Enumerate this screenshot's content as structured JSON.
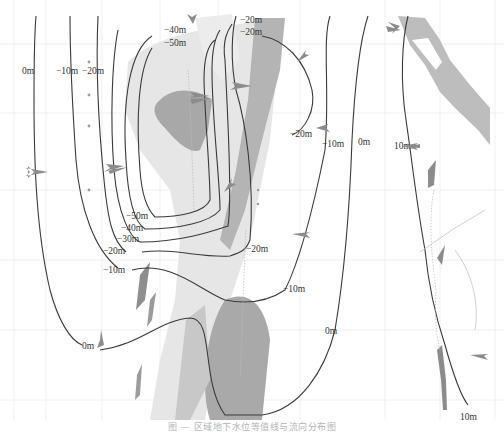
{
  "figure": {
    "type": "contour-map",
    "caption": "图 — 区域地下水位等值线与流向分布图",
    "colors": {
      "contour": "#3a3a3a",
      "zone_light": "#e2e2e2",
      "zone_medium": "#c4c4c4",
      "zone_dark": "#9c9c9c",
      "arrow": "#8c8c8c",
      "grid": "#ececec"
    }
  },
  "contour_labels": [
    {
      "text": "0m",
      "x": 28,
      "y": 74
    },
    {
      "text": "−10m",
      "x": 56,
      "y": 74
    },
    {
      "text": "−20m",
      "x": 86,
      "y": 74
    },
    {
      "text": "−40m",
      "x": 163,
      "y": 33
    },
    {
      "text": "−50m",
      "x": 163,
      "y": 46
    },
    {
      "text": "−20m",
      "x": 241,
      "y": 24
    },
    {
      "text": "−20m",
      "x": 241,
      "y": 35
    },
    {
      "text": "−20m",
      "x": 290,
      "y": 137
    },
    {
      "text": "−10m",
      "x": 322,
      "y": 145
    },
    {
      "text": "0m",
      "x": 358,
      "y": 145
    },
    {
      "text": "10m",
      "x": 396,
      "y": 148
    },
    {
      "text": "−50m",
      "x": 126,
      "y": 219
    },
    {
      "text": "−40m",
      "x": 121,
      "y": 231
    },
    {
      "text": "−30m",
      "x": 117,
      "y": 242
    },
    {
      "text": "−20m",
      "x": 103,
      "y": 253
    },
    {
      "text": "−20m",
      "x": 246,
      "y": 251
    },
    {
      "text": "−10m",
      "x": 103,
      "y": 273
    },
    {
      "text": "−10m",
      "x": 283,
      "y": 291
    },
    {
      "text": "0m",
      "x": 325,
      "y": 333
    },
    {
      "text": "0m",
      "x": 82,
      "y": 349
    },
    {
      "text": "10m",
      "x": 462,
      "y": 420
    }
  ],
  "legend_note": "Contours labelled in metres; grey arrows indicate flow direction; shaded areas indicate zones"
}
